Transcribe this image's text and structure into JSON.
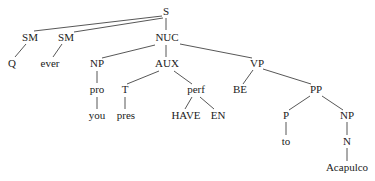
{
  "diagram": {
    "type": "syntax-tree",
    "nodes": {
      "S": "S",
      "SM1": "SM",
      "SM2": "SM",
      "NUC": "NUC",
      "Q": "Q",
      "ever": "ever",
      "NP1": "NP",
      "AUX": "AUX",
      "VP": "VP",
      "pro": "pro",
      "T": "T",
      "perf": "perf",
      "BE": "BE",
      "PP": "PP",
      "you": "you",
      "pres": "pres",
      "HAVE": "HAVE",
      "EN": "EN",
      "P": "P",
      "NP2": "NP",
      "to": "to",
      "N": "N",
      "Acapulco": "Acapulco"
    },
    "edges": [
      [
        "S",
        "SM1"
      ],
      [
        "S",
        "SM2"
      ],
      [
        "S",
        "NUC"
      ],
      [
        "SM1",
        "Q"
      ],
      [
        "SM2",
        "ever"
      ],
      [
        "NUC",
        "NP1"
      ],
      [
        "NUC",
        "AUX"
      ],
      [
        "NUC",
        "VP"
      ],
      [
        "NP1",
        "pro"
      ],
      [
        "pro",
        "you"
      ],
      [
        "AUX",
        "T"
      ],
      [
        "AUX",
        "perf"
      ],
      [
        "T",
        "pres"
      ],
      [
        "perf",
        "HAVE"
      ],
      [
        "perf",
        "EN"
      ],
      [
        "VP",
        "BE"
      ],
      [
        "VP",
        "PP"
      ],
      [
        "PP",
        "P"
      ],
      [
        "PP",
        "NP2"
      ],
      [
        "P",
        "to"
      ],
      [
        "NP2",
        "N"
      ],
      [
        "N",
        "Acapulco"
      ]
    ]
  }
}
